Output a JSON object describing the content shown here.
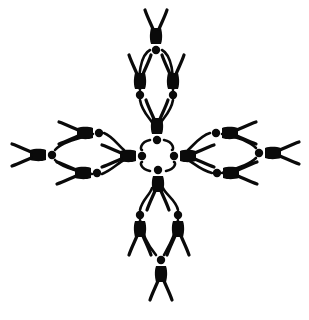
{
  "illustration": {
    "subject": "human figures linked hand-to-foot forming a cross",
    "background": "#ffffff",
    "ink_color": "#0a0a0a",
    "center": [
      156,
      155
    ],
    "central_ring_figures": 4,
    "arms": [
      {
        "name": "top",
        "figures": 3
      },
      {
        "name": "right",
        "figures": 3
      },
      {
        "name": "bottom",
        "figures": 3
      },
      {
        "name": "left",
        "figures": 3
      }
    ],
    "total_figures": 16
  }
}
